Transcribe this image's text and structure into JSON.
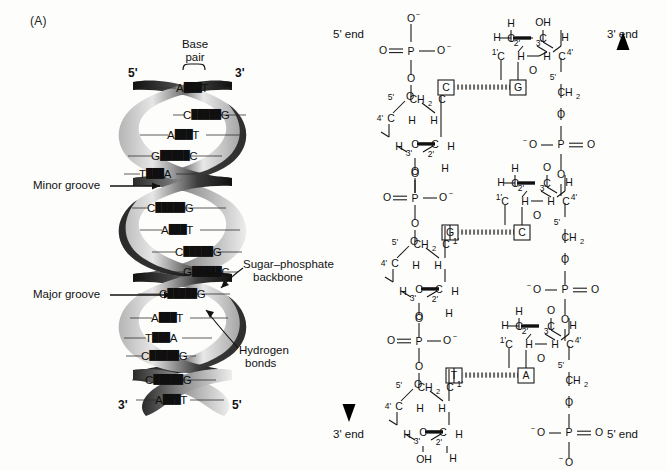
{
  "figure": {
    "panel_label": "(A)"
  },
  "helix": {
    "top_left_prime": "5'",
    "top_right_prime": "3'",
    "bottom_left_prime": "3'",
    "bottom_right_prime": "5'",
    "base_pair_caption_line1": "Base",
    "base_pair_caption_line2": "pair",
    "minor_groove_label": "Minor groove",
    "major_groove_label": "Major groove",
    "sugar_backbone_label_line1": "Sugar–phosphate",
    "sugar_backbone_label_line2": "backbone",
    "hydrogen_bonds_label_line1": "Hydrogen",
    "hydrogen_bonds_label_line2": "bonds",
    "base_pairs": [
      {
        "left": "A",
        "right": "T",
        "bonds": 2
      },
      {
        "left": "C",
        "right": "G",
        "bonds": 3
      },
      {
        "left": "A",
        "right": "T",
        "bonds": 2
      },
      {
        "left": "G",
        "right": "C",
        "bonds": 3
      },
      {
        "left": "T",
        "right": "A",
        "bonds": 2
      },
      {
        "left": "C",
        "right": "G",
        "bonds": 3
      },
      {
        "left": "A",
        "right": "T",
        "bonds": 2
      },
      {
        "left": "C",
        "right": "G",
        "bonds": 3
      },
      {
        "left": "G",
        "right": "C",
        "bonds": 3
      },
      {
        "left": "C",
        "right": "G",
        "bonds": 3
      },
      {
        "left": "A",
        "right": "T",
        "bonds": 2
      },
      {
        "left": "T",
        "right": "A",
        "bonds": 2
      },
      {
        "left": "C",
        "right": "G",
        "bonds": 3
      },
      {
        "left": "C",
        "right": "G",
        "bonds": 3
      },
      {
        "left": "A",
        "right": "T",
        "bonds": 2
      }
    ]
  },
  "chemical": {
    "left_strand_top_label": "5' end",
    "left_strand_bottom_label": "3' end",
    "right_strand_top_label": "3' end",
    "right_strand_bottom_label": "5' end",
    "left_arrow_direction": "down",
    "right_arrow_direction": "up",
    "base_pairs": [
      {
        "left_base": "C",
        "right_base": "G"
      },
      {
        "left_base": "G",
        "right_base": "C"
      },
      {
        "left_base": "T",
        "right_base": "A"
      }
    ],
    "atoms": {
      "phosphorus": "P",
      "oxygen": "O",
      "oxygen_anion": "O⁻",
      "carbon": "C",
      "hydrogen": "H",
      "hydroxyl": "OH",
      "methylene": "CH₂"
    },
    "carbon_numbers": [
      "1'",
      "2'",
      "3'",
      "4'",
      "5'"
    ]
  },
  "colors": {
    "ink": "#111111",
    "ribbon_dark": "#1c1c1c",
    "ribbon_light": "#c9c9c9",
    "background": "#fdfdfc"
  }
}
